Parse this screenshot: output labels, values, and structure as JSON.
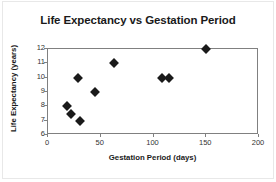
{
  "chart_data": {
    "type": "scatter",
    "title": "Life Expectancy vs Gestation Period",
    "xlabel": "Gestation Period (days)",
    "ylabel": "Life Expectancy (years)",
    "xlim": [
      0,
      200
    ],
    "ylim": [
      6,
      12
    ],
    "xticks": [
      0,
      50,
      100,
      150,
      200
    ],
    "yticks": [
      6,
      7,
      8,
      9,
      10,
      11,
      12
    ],
    "grid": false,
    "legend": null,
    "marker": "diamond",
    "marker_color": "#1a1a1a",
    "points": [
      {
        "x": 18,
        "y": 8
      },
      {
        "x": 22,
        "y": 7.5
      },
      {
        "x": 28,
        "y": 10
      },
      {
        "x": 30,
        "y": 7
      },
      {
        "x": 45,
        "y": 9
      },
      {
        "x": 63,
        "y": 11
      },
      {
        "x": 108,
        "y": 10
      },
      {
        "x": 115,
        "y": 10
      },
      {
        "x": 150,
        "y": 12
      }
    ]
  },
  "axis": {
    "x_tick_labels": [
      "0",
      "50",
      "100",
      "150",
      "200"
    ],
    "y_tick_labels": [
      "12",
      "11",
      "10",
      "9",
      "8",
      "7",
      "6"
    ]
  },
  "colors": {
    "axis": "#808080",
    "text": "#1a1a1a",
    "marker": "#1a1a1a",
    "frame": "#e8e8e8"
  }
}
